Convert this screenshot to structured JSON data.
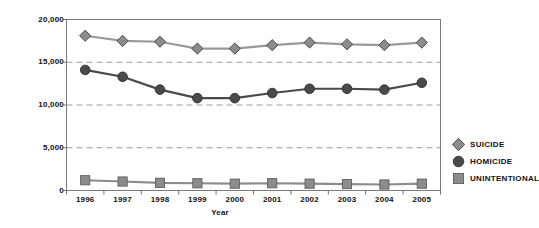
{
  "chart_data": {
    "type": "line",
    "title": "",
    "xlabel": "Year",
    "ylabel": "Deaths",
    "x": [
      1996,
      1997,
      1998,
      1999,
      2000,
      2001,
      2002,
      2003,
      2004,
      2005
    ],
    "categories": [
      "1996",
      "1997",
      "1998",
      "1999",
      "2000",
      "2001",
      "2002",
      "2003",
      "2004",
      "2005"
    ],
    "ylim": [
      0,
      20000
    ],
    "yticks": [
      0,
      5000,
      10000,
      15000,
      20000
    ],
    "ytick_labels": [
      "0",
      "5,000",
      "10,000",
      "15,000",
      "20,000"
    ],
    "grid": "horizontal-dashed",
    "legend_position": "right",
    "series": [
      {
        "name": "SUICIDE",
        "marker": "diamond",
        "color": "#8c8c8c",
        "line_color": "#9a9a9a",
        "values": [
          18100,
          17500,
          17400,
          16600,
          16600,
          17000,
          17300,
          17100,
          17000,
          17300
        ]
      },
      {
        "name": "HOMICIDE",
        "marker": "circle",
        "color": "#4a4a4a",
        "line_color": "#4a4a4a",
        "values": [
          14100,
          13300,
          11800,
          10800,
          10800,
          11400,
          11900,
          11900,
          11800,
          12600
        ]
      },
      {
        "name": "UNINTENTIONAL",
        "marker": "square",
        "color": "#8c8c8c",
        "line_color": "#8c8c8c",
        "values": [
          1200,
          1050,
          900,
          850,
          800,
          850,
          800,
          750,
          700,
          800
        ]
      }
    ]
  },
  "axes": {
    "y_title": "Deaths",
    "x_title": "Year",
    "y_tick_labels": [
      "20,000",
      "15,000",
      "10,000",
      "5,000",
      "0"
    ],
    "x_tick_labels": [
      "1996",
      "1997",
      "1998",
      "1999",
      "2000",
      "2001",
      "2002",
      "2003",
      "2004",
      "2005"
    ]
  },
  "legend": {
    "items": [
      {
        "label": "SUICIDE",
        "marker": "diamond",
        "color": "#8c8c8c"
      },
      {
        "label": "HOMICIDE",
        "marker": "circle",
        "color": "#4a4a4a"
      },
      {
        "label": "UNINTENTIONAL",
        "marker": "square",
        "color": "#8c8c8c"
      }
    ]
  },
  "style": {
    "plot_border_color": "#7a7a7a",
    "grid_color": "#9d9d9d",
    "background": "#ffffff",
    "text_color": "#111111"
  }
}
